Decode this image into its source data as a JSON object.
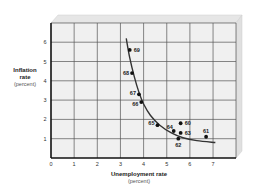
{
  "chart_data": {
    "type": "scatter",
    "title": "",
    "xlabel": "Unemployment rate",
    "xlabel_sub": "(percent)",
    "ylabel": "Inflation rate",
    "ylabel_line1": "Inflation",
    "ylabel_line2": "rate",
    "ylabel_sub": "(percent)",
    "xlim": [
      0,
      8
    ],
    "ylim": [
      0,
      7
    ],
    "x_ticks": [
      "0",
      "1",
      "2",
      "3",
      "4",
      "5",
      "6",
      "7"
    ],
    "y_ticks": [
      "1",
      "2",
      "3",
      "4",
      "5",
      "6"
    ],
    "grid": true,
    "legend": null,
    "points": [
      {
        "label": "60",
        "x": 5.6,
        "y": 1.8
      },
      {
        "label": "61",
        "x": 6.7,
        "y": 1.1
      },
      {
        "label": "62",
        "x": 5.5,
        "y": 1.0
      },
      {
        "label": "63",
        "x": 5.6,
        "y": 1.3
      },
      {
        "label": "64",
        "x": 5.3,
        "y": 1.4
      },
      {
        "label": "65",
        "x": 4.6,
        "y": 1.7
      },
      {
        "label": "66",
        "x": 3.9,
        "y": 2.9
      },
      {
        "label": "67",
        "x": 3.8,
        "y": 3.3
      },
      {
        "label": "68",
        "x": 3.5,
        "y": 4.4
      },
      {
        "label": "69",
        "x": 3.4,
        "y": 5.6
      }
    ],
    "curve": {
      "name": "Phillips curve (fitted)",
      "x": [
        3.25,
        3.4,
        3.6,
        3.8,
        4.0,
        4.3,
        4.7,
        5.2,
        5.7,
        6.3,
        7.1
      ],
      "y": [
        6.2,
        5.2,
        4.2,
        3.4,
        2.8,
        2.2,
        1.7,
        1.3,
        1.05,
        0.9,
        0.8
      ]
    },
    "colors": {
      "plot_bg": "#f0f0f0",
      "grid": "#555555",
      "axis": "#111111",
      "curve": "#333333",
      "points": "#111111",
      "box_face": "#e4e4e4"
    }
  }
}
